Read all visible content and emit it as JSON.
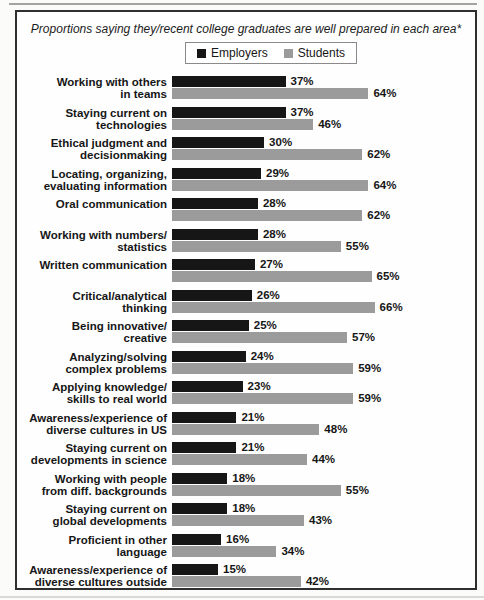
{
  "figure": {
    "title": "Proportions saying they/recent college graduates are well prepared in each area*",
    "footnote": "*8-10 ratings on zero-to-ten scale"
  },
  "chart_data": {
    "type": "bar",
    "orientation": "horizontal",
    "title": "Proportions saying they/recent college graduates are well prepared in each area*",
    "footnote": "*8-10 ratings on zero-to-ten scale",
    "value_suffix": "%",
    "xlim": [
      0,
      70
    ],
    "grid": false,
    "legend_position": "top-center",
    "categories": [
      "Working with others\nin teams",
      "Staying current on\ntechnologies",
      "Ethical judgment and\ndecisionmaking",
      "Locating, organizing,\nevaluating information",
      "Oral communication",
      "Working with numbers/\nstatistics",
      "Written communication",
      "Critical/analytical\nthinking",
      "Being innovative/\ncreative",
      "Analyzing/solving\ncomplex problems",
      "Applying knowledge/\nskills to real world",
      "Awareness/experience of\ndiverse cultures in US",
      "Staying current on\ndevelopments in science",
      "Working with people\nfrom diff. backgrounds",
      "Staying current on\nglobal developments",
      "Proficient in other\nlanguage",
      "Awareness/experience of\ndiverse cultures outside\nUS"
    ],
    "series": [
      {
        "name": "Employers",
        "color": "#161616",
        "values": [
          37,
          37,
          30,
          29,
          28,
          28,
          27,
          26,
          25,
          24,
          23,
          21,
          21,
          18,
          18,
          16,
          15
        ]
      },
      {
        "name": "Students",
        "color": "#9b9b9b",
        "values": [
          64,
          46,
          62,
          64,
          62,
          55,
          65,
          66,
          57,
          59,
          59,
          48,
          44,
          55,
          43,
          34,
          42
        ]
      }
    ]
  }
}
